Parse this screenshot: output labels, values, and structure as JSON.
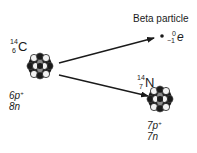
{
  "diagram": {
    "parent": {
      "symbol": "C",
      "mass_number": "14",
      "atomic_number": "6",
      "protons": "6p",
      "proton_charge": "+",
      "neutrons": "8n"
    },
    "beta": {
      "label": "Beta particle",
      "symbol": "e",
      "mass_number": "0",
      "atomic_number": "−1"
    },
    "daughter": {
      "symbol": "N",
      "mass_number": "14",
      "atomic_number": "7",
      "protons": "7p",
      "proton_charge": "+",
      "neutrons": "7n"
    },
    "colors": {
      "ink": "#1a1a1a",
      "background": "#ffffff",
      "nucleon_light": "#f2f2f2",
      "nucleon_mid": "#8a8a8a"
    }
  }
}
